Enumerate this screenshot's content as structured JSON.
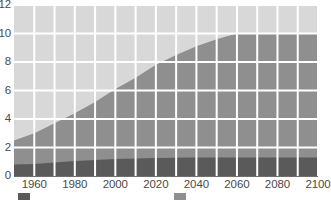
{
  "chart_data": {
    "type": "area",
    "stacked": true,
    "title": "",
    "subtitle": "",
    "xlabel": "",
    "ylabel": "",
    "xlim": [
      1950,
      2100
    ],
    "ylim": [
      0,
      12
    ],
    "x": [
      1950,
      1960,
      1970,
      1980,
      1990,
      2000,
      2010,
      2020,
      2030,
      2040,
      2050,
      2060,
      2070,
      2080,
      2090,
      2100
    ],
    "xticks": [
      1960,
      1980,
      2000,
      2020,
      2040,
      2060,
      2080,
      2100
    ],
    "xtick_labels": [
      "1960",
      "1980",
      "2000",
      "2020",
      "2040",
      "2060",
      "2080",
      "2100"
    ],
    "yticks": [
      0,
      2,
      4,
      6,
      8,
      10,
      12
    ],
    "ytick_labels": [
      "0",
      "2",
      "4",
      "6",
      "8",
      "10",
      "12"
    ],
    "grid": true,
    "grid_color": "#ffffff",
    "legend_position": "bottom",
    "series": [
      {
        "name": "",
        "color": "#5a5a5a",
        "values": [
          0.8,
          0.85,
          0.95,
          1.05,
          1.12,
          1.2,
          1.23,
          1.26,
          1.28,
          1.29,
          1.3,
          1.3,
          1.3,
          1.3,
          1.3,
          1.3
        ]
      },
      {
        "name": "",
        "color": "#8f8f8f",
        "values": [
          1.7,
          2.15,
          2.75,
          3.35,
          4.08,
          4.9,
          5.67,
          6.54,
          7.22,
          7.82,
          8.3,
          8.7,
          8.7,
          8.7,
          8.7,
          8.7
        ]
      },
      {
        "name": "",
        "color": "#d8d8d8",
        "values": [
          0.0,
          0.0,
          0.0,
          0.0,
          0.0,
          0.0,
          0.0,
          0.0,
          0.0,
          0.0,
          0.0,
          0.1,
          0.45,
          0.75,
          1.0,
          1.2
        ]
      }
    ],
    "cumulative_band_tops": {
      "band1_top": [
        0.8,
        0.85,
        0.95,
        1.05,
        1.12,
        1.2,
        1.23,
        1.26,
        1.28,
        1.29,
        1.3,
        1.3,
        1.3,
        1.3,
        1.3,
        1.3
      ],
      "band2_top": [
        2.5,
        3.0,
        3.7,
        4.4,
        5.2,
        6.1,
        6.9,
        7.8,
        8.5,
        9.11,
        9.6,
        10.0,
        10.0,
        10.0,
        10.0,
        10.0
      ],
      "band3_top": [
        2.5,
        3.0,
        3.7,
        4.4,
        5.2,
        6.1,
        6.9,
        7.8,
        8.5,
        9.11,
        9.6,
        10.1,
        10.45,
        10.75,
        11.0,
        11.2
      ]
    }
  },
  "legend": {
    "entries": [
      {
        "label": "",
        "color": "#5a5a5a"
      },
      {
        "label": "",
        "color": "#8f8f8f"
      }
    ]
  },
  "axes": {
    "axis_line_color": "#6e6e6e",
    "tick_label_color": "#4a4a4a"
  }
}
